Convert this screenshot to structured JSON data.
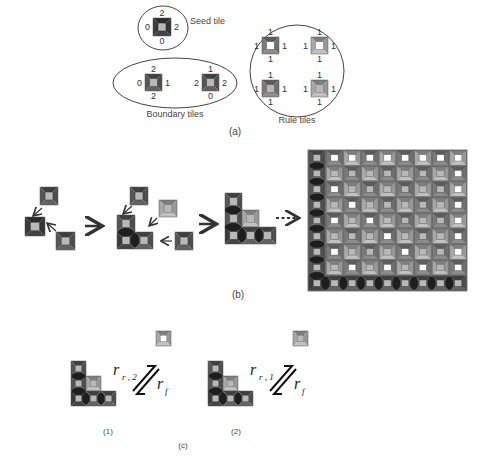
{
  "panel_a": {
    "caption": "(a)",
    "seed": {
      "label": "Seed tile",
      "kind": "seed",
      "glues": {
        "top": "2",
        "right": "2",
        "bottom": "0",
        "left": "0"
      }
    },
    "boundary": {
      "label": "Boundary tiles",
      "tiles": [
        {
          "kind": "boundary-v",
          "glues": {
            "top": "2",
            "right": "1",
            "bottom": "2",
            "left": "0"
          }
        },
        {
          "kind": "boundary-h",
          "glues": {
            "top": "1",
            "right": "2",
            "bottom": "0",
            "left": "2"
          }
        }
      ]
    },
    "rule": {
      "label": "Rule tiles",
      "tiles": [
        {
          "kind": "rule-white-dark",
          "glues": {
            "top": "1",
            "right": "1",
            "bottom": "1",
            "left": "1"
          }
        },
        {
          "kind": "rule-white-light",
          "glues": {
            "top": "1",
            "right": "1",
            "bottom": "1",
            "left": "1"
          }
        },
        {
          "kind": "rule-gray-dark",
          "glues": {
            "top": "1",
            "right": "1",
            "bottom": "1",
            "left": "1"
          }
        },
        {
          "kind": "rule-gray-light",
          "glues": {
            "top": "1",
            "right": "1",
            "bottom": "1",
            "left": "1"
          }
        }
      ]
    }
  },
  "panel_b": {
    "caption": "(b)",
    "grid": {
      "cols": 9,
      "rows": 9,
      "white_cells": [
        [
          0,
          1
        ],
        [
          0,
          2
        ],
        [
          0,
          3
        ],
        [
          0,
          4
        ],
        [
          0,
          5
        ],
        [
          0,
          6
        ],
        [
          0,
          7
        ],
        [
          0,
          8
        ],
        [
          1,
          8
        ],
        [
          2,
          1
        ],
        [
          2,
          8
        ],
        [
          3,
          2
        ],
        [
          3,
          8
        ],
        [
          4,
          1
        ],
        [
          4,
          3
        ],
        [
          4,
          8
        ],
        [
          5,
          4
        ],
        [
          5,
          8
        ],
        [
          6,
          1
        ],
        [
          6,
          5
        ],
        [
          6,
          8
        ],
        [
          7,
          2
        ],
        [
          7,
          4
        ],
        [
          7,
          6
        ],
        [
          7,
          8
        ]
      ]
    }
  },
  "panel_c": {
    "caption": "(c)",
    "cases": [
      {
        "label": "(1)",
        "forward_rate": "r",
        "forward_sub": "r , 2",
        "reverse_rate": "r",
        "reverse_sub": "f",
        "incoming_kind": "rule-white-light"
      },
      {
        "label": "(2)",
        "forward_rate": "r",
        "forward_sub": "r , 1",
        "reverse_rate": "r",
        "reverse_sub": "f",
        "incoming_kind": "rule-gray-light"
      }
    ]
  },
  "colors": {
    "seed_frame": "#3a3a3a",
    "boundary_frame": "#555555",
    "rule_dark": "#7a7a7a",
    "rule_light": "#a8a8a8",
    "center_gray": "#b8b8b8",
    "center_white": "#ffffff",
    "glue_blob": "#1e1e1e",
    "grid_bg": "#8c8c8c"
  }
}
